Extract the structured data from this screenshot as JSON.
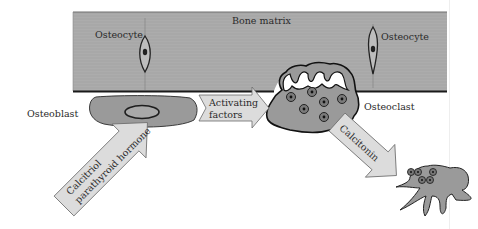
{
  "diagram": {
    "colors": {
      "bone_matrix": "#a9a9a9",
      "bone_edge": "#1a1a1a",
      "cell_fill": "#9c9c9c",
      "arrow_fill": "#dcdcdc",
      "arrow_stroke": "#6a6a6a",
      "nucleus": "#333333",
      "text": "#2a2a2a"
    },
    "labels": {
      "bone_matrix": "Bone matrix",
      "osteocyte_left": "Osteocyte",
      "osteocyte_right": "Osteocyte",
      "osteoblast": "Osteoblast",
      "osteoclast": "Osteoclast"
    },
    "arrows": {
      "calcitriol_line1": "Calcitriol",
      "calcitriol_line2": "parathyroid hormone",
      "activating_line1": "Activating",
      "activating_line2": "factors",
      "calcitonin": "Calcitonin"
    },
    "nodes": [
      {
        "id": "bone-matrix",
        "label": "Bone matrix"
      },
      {
        "id": "osteocyte-left",
        "label": "Osteocyte"
      },
      {
        "id": "osteocyte-right",
        "label": "Osteocyte"
      },
      {
        "id": "osteoblast",
        "label": "Osteoblast"
      },
      {
        "id": "osteoclast",
        "label": "Osteoclast"
      },
      {
        "id": "inactive-osteoclast",
        "label": ""
      }
    ],
    "edges": [
      {
        "from": "external",
        "to": "osteoblast",
        "label": "Calcitriol parathyroid hormone"
      },
      {
        "from": "osteoblast",
        "to": "osteoclast",
        "label": "Activating factors"
      },
      {
        "from": "osteoclast",
        "to": "inactive-osteoclast",
        "label": "Calcitonin"
      }
    ]
  }
}
